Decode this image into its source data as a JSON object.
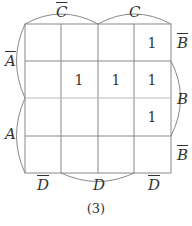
{
  "diagram": {
    "type": "karnaugh-map",
    "caption": "(3)",
    "top_labels": {
      "c_bar": "C",
      "c": "C"
    },
    "left_labels": {
      "a_bar": "A",
      "a": "A"
    },
    "right_labels": {
      "b_bar_top": "B",
      "b": "B",
      "b_bar_bottom": "B"
    },
    "bottom_labels": {
      "d_bar_left": "D",
      "d": "D",
      "d_bar_right": "D"
    },
    "cells": [
      [
        "",
        "",
        "",
        "1"
      ],
      [
        "",
        "1",
        "1",
        "1"
      ],
      [
        "",
        "",
        "",
        "1"
      ],
      [
        "",
        "",
        "",
        ""
      ]
    ]
  }
}
